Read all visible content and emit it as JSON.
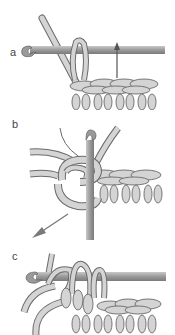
{
  "figure": {
    "panels": [
      {
        "id": "a",
        "label": "a",
        "description": "Hook inserted through loop with yarn over; arrow marks stitch"
      },
      {
        "id": "b",
        "label": "b",
        "description": "Hook rotated vertically, yarn wrapped around, arrow indicating direction to pull"
      },
      {
        "id": "c",
        "label": "c",
        "description": "Hook horizontal with multiple loops on hook above stitch row"
      }
    ],
    "colors": {
      "yarn_fill": "#d4d4d4",
      "yarn_stroke": "#6a6a6a",
      "hook_fill": "#9a9a9a",
      "hook_light": "#c4c4c4",
      "arrow": "#7a7a7a",
      "background": "#ffffff"
    }
  }
}
